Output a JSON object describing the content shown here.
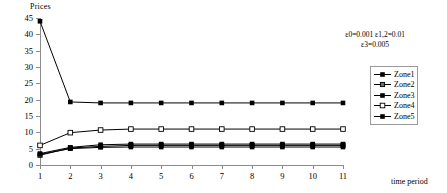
{
  "chart_data": {
    "type": "line",
    "title": "",
    "ylabel": "Prices",
    "xlabel": "time period",
    "x": [
      1,
      2,
      3,
      4,
      5,
      6,
      7,
      8,
      9,
      10,
      11
    ],
    "xlim": [
      1,
      11
    ],
    "ylim": [
      0,
      45
    ],
    "yticks": [
      0,
      5,
      10,
      15,
      20,
      25,
      30,
      35,
      40,
      45
    ],
    "xticks": [
      1,
      2,
      3,
      4,
      5,
      6,
      7,
      8,
      9,
      10,
      11
    ],
    "grid": false,
    "legend_position": "right",
    "annotation_lines": [
      "ε0=0.001 ε1,2=0.01",
      "ε3=0.005"
    ],
    "series": [
      {
        "name": "Zone1",
        "marker": "filled-square",
        "color": "#000000",
        "values": [
          44.0,
          19.3,
          19.0,
          19.0,
          19.0,
          19.0,
          19.0,
          19.0,
          19.0,
          19.0,
          19.0
        ]
      },
      {
        "name": "Zone2",
        "marker": "gray-square",
        "color": "#000000",
        "values": [
          3.0,
          5.2,
          5.7,
          6.0,
          6.0,
          6.0,
          6.0,
          6.0,
          6.0,
          6.0,
          6.0
        ]
      },
      {
        "name": "Zone3",
        "marker": "filled-square",
        "color": "#000000",
        "values": [
          3.5,
          5.4,
          6.2,
          6.4,
          6.4,
          6.4,
          6.4,
          6.4,
          6.4,
          6.4,
          6.4
        ]
      },
      {
        "name": "Zone4",
        "marker": "open-square",
        "color": "#000000",
        "values": [
          6.0,
          9.9,
          10.7,
          11.0,
          11.0,
          11.0,
          11.0,
          11.0,
          11.0,
          11.0,
          11.0
        ]
      },
      {
        "name": "Zone5",
        "marker": "filled-square",
        "color": "#000000",
        "values": [
          3.3,
          5.0,
          5.4,
          5.5,
          5.5,
          5.5,
          5.5,
          5.5,
          5.5,
          5.5,
          5.5
        ]
      }
    ]
  },
  "legend": {
    "items": [
      {
        "label": "Zone1"
      },
      {
        "label": "Zone2"
      },
      {
        "label": "Zone3"
      },
      {
        "label": "Zone4"
      },
      {
        "label": "Zone5"
      }
    ]
  },
  "annotation": {
    "line1": "ε0=0.001 ε1,2=0.01",
    "line2": "ε3=0.005"
  },
  "axes": {
    "y_title": "Prices",
    "x_title": "time period"
  }
}
